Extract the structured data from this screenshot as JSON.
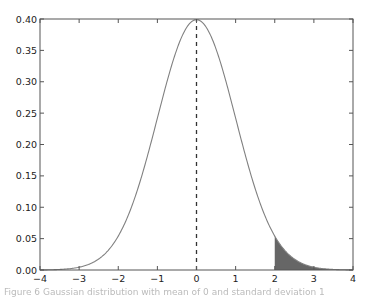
{
  "chart_data": {
    "type": "line",
    "title": "",
    "xlabel": "",
    "ylabel": "",
    "xlim": [
      -4,
      4
    ],
    "ylim": [
      0.0,
      0.4
    ],
    "grid": false,
    "legend": null,
    "x_ticks": [
      "−4",
      "−3",
      "−2",
      "−1",
      "0",
      "1",
      "2",
      "3",
      "4"
    ],
    "y_ticks": [
      "0.00",
      "0.05",
      "0.10",
      "0.15",
      "0.20",
      "0.25",
      "0.30",
      "0.35",
      "0.40"
    ],
    "series": [
      {
        "name": "Standard normal PDF (mean 0, sd 1)",
        "x": [
          -4,
          -3.5,
          -3,
          -2.5,
          -2,
          -1.5,
          -1,
          -0.5,
          0,
          0.5,
          1,
          1.5,
          2,
          2.5,
          3,
          3.5,
          4
        ],
        "values": [
          0.0001,
          0.0009,
          0.0044,
          0.0175,
          0.054,
          0.1295,
          0.242,
          0.3521,
          0.3989,
          0.3521,
          0.242,
          0.1295,
          0.054,
          0.0175,
          0.0044,
          0.0009,
          0.0001
        ],
        "color": "#808080"
      }
    ],
    "annotations": [
      {
        "type": "vertical-dashed-line",
        "x": 0,
        "from_y": 0,
        "to_y": 0.3989,
        "color": "#333333"
      },
      {
        "type": "shaded-area",
        "from_x": 2,
        "to_x": 4,
        "under": "curve",
        "color": "#666666"
      }
    ]
  },
  "caption": "Figure 6  Gaussian distribution with mean of 0 and standard deviation 1"
}
